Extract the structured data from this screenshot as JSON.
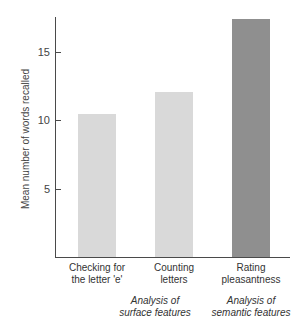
{
  "chart_data": {
    "type": "bar",
    "title": "",
    "xlabel": "",
    "ylabel": "Mean number of words recalled",
    "ylim": [
      0,
      17.6
    ],
    "yticks": [
      5,
      10,
      15
    ],
    "grid": false,
    "categories": [
      "Checking for the letter 'e'",
      "Counting letters",
      "Rating pleasantness"
    ],
    "values": [
      10.5,
      12.1,
      17.5
    ],
    "bar_colors": [
      "#d9d9d9",
      "#d9d9d9",
      "#8f8f8f"
    ],
    "groups": [
      {
        "label": "Analysis of surface features",
        "categories": [
          0,
          1
        ]
      },
      {
        "label": "Analysis of semantic features",
        "categories": [
          2
        ]
      }
    ]
  },
  "axis": {
    "ylabel": "Mean number of words recalled",
    "ticks": [
      {
        "value": 5,
        "label": "5"
      },
      {
        "value": 10,
        "label": "10"
      },
      {
        "value": 15,
        "label": "15"
      }
    ]
  },
  "categories": [
    {
      "line1": "Checking for",
      "line2": "the letter 'e'"
    },
    {
      "line1": "Counting",
      "line2": "letters"
    },
    {
      "line1": "Rating",
      "line2": "pleasantness"
    }
  ],
  "groups": [
    {
      "line1": "Analysis of",
      "line2": "surface features"
    },
    {
      "line1": "Analysis of",
      "line2": "semantic features"
    }
  ]
}
